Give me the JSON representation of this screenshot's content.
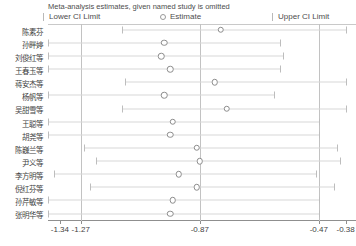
{
  "header": {
    "title": "Meta-analysis estimates, given named study is omitted",
    "legend": [
      {
        "key": "lower",
        "label": "Lower CI Limit",
        "icon": "tick-marker-icon"
      },
      {
        "key": "estimate",
        "label": "Estimate",
        "icon": "open-circle-icon"
      },
      {
        "key": "upper",
        "label": "Upper CI Limit",
        "icon": "tick-marker-icon"
      }
    ]
  },
  "axis": {
    "ticks": [
      -1.34,
      -1.27,
      -0.87,
      -0.47,
      -0.38
    ],
    "tick_labels": [
      "-1.34",
      "-1.27",
      "-0.87",
      "-0.47",
      "-0.38"
    ],
    "min": -1.38,
    "max": -0.345,
    "reference_lines": [
      -1.27,
      -0.87,
      -0.47
    ]
  },
  "colors": {
    "marker_stroke": "#8d8d8d",
    "ci_line": "#d8d8d8",
    "reference_line": "#c2c2c2",
    "axis": "#8f8f8f",
    "text": "#3f3f3f",
    "title_text": "#4d4d4d",
    "background": "#ffffff"
  },
  "chart_data": {
    "type": "scatter",
    "title": "Meta-analysis estimates, given named study is omitted",
    "xlabel": "",
    "ylabel": "",
    "xlim": [
      -1.38,
      -0.345
    ],
    "grid": false,
    "legend_position": "top",
    "categories": [
      "陈素芬",
      "孙畔婷",
      "刘俊红等",
      "王春玉等",
      "蒋安杰等",
      "杨帆等",
      "吴甜雪等",
      "王聪等",
      "胡尧等",
      "陈巍兰等",
      "尹义等",
      "李方明等",
      "倪红芬等",
      "孙芹敏等",
      "张明华等"
    ],
    "series": [
      {
        "name": "Estimate",
        "values": [
          -0.8,
          -0.99,
          -1.0,
          -0.97,
          -0.82,
          -0.99,
          -0.78,
          -0.96,
          -0.97,
          -0.88,
          -0.87,
          -0.94,
          -0.88,
          -0.96,
          -0.97
        ]
      },
      {
        "name": "Lower CI Limit",
        "values": [
          -1.13,
          -1.38,
          -1.38,
          -1.38,
          -1.12,
          -1.38,
          -1.13,
          -1.38,
          -1.38,
          -1.26,
          -1.22,
          -1.36,
          -1.24,
          -1.38,
          -1.38
        ]
      },
      {
        "name": "Upper CI Limit",
        "values": [
          -0.38,
          -0.6,
          -0.59,
          -0.6,
          -0.38,
          -0.62,
          -0.38,
          -0.47,
          -0.47,
          -0.41,
          -0.4,
          -0.48,
          -0.42,
          -0.47,
          -0.47
        ]
      }
    ]
  },
  "rows": [
    {
      "label": "陈素芬",
      "estimate": -0.8,
      "lower": -1.13,
      "upper": -0.38
    },
    {
      "label": "孙畔婷",
      "estimate": -0.99,
      "lower": -1.38,
      "upper": -0.6
    },
    {
      "label": "刘俊红等",
      "estimate": -1.0,
      "lower": -1.38,
      "upper": -0.59
    },
    {
      "label": "王春玉等",
      "estimate": -0.97,
      "lower": -1.38,
      "upper": -0.6
    },
    {
      "label": "蒋安杰等",
      "estimate": -0.82,
      "lower": -1.12,
      "upper": -0.38
    },
    {
      "label": "杨帆等",
      "estimate": -0.99,
      "lower": -1.38,
      "upper": -0.62
    },
    {
      "label": "吴甜雪等",
      "estimate": -0.78,
      "lower": -1.13,
      "upper": -0.38
    },
    {
      "label": "王聪等",
      "estimate": -0.96,
      "lower": -1.38,
      "upper": -0.47
    },
    {
      "label": "胡尧等",
      "estimate": -0.97,
      "lower": -1.38,
      "upper": -0.47
    },
    {
      "label": "陈巍兰等",
      "estimate": -0.88,
      "lower": -1.26,
      "upper": -0.41
    },
    {
      "label": "尹义等",
      "estimate": -0.87,
      "lower": -1.22,
      "upper": -0.4
    },
    {
      "label": "李方明等",
      "estimate": -0.94,
      "lower": -1.36,
      "upper": -0.48
    },
    {
      "label": "倪红芬等",
      "estimate": -0.88,
      "lower": -1.24,
      "upper": -0.42
    },
    {
      "label": "孙芹敏等",
      "estimate": -0.96,
      "lower": -1.38,
      "upper": -0.47
    },
    {
      "label": "张明华等",
      "estimate": -0.97,
      "lower": -1.38,
      "upper": -0.47
    }
  ]
}
